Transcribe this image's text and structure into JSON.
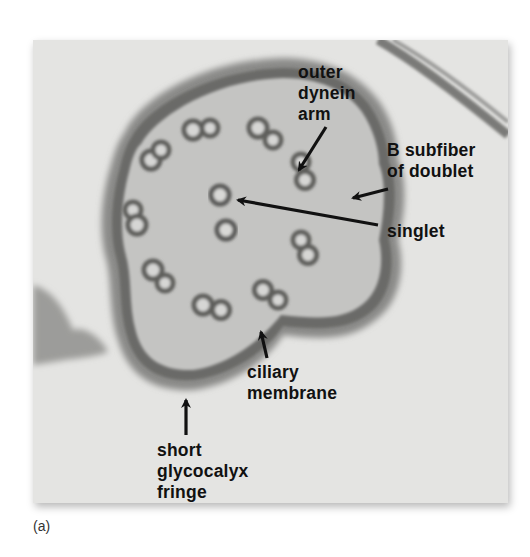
{
  "figure": {
    "panel_label": "(a)",
    "labels": [
      {
        "id": "outer-dynein-arm",
        "text": "outer\ndynein\narm"
      },
      {
        "id": "b-subfiber",
        "text": "B subfiber\nof doublet"
      },
      {
        "id": "singlet",
        "text": "singlet"
      },
      {
        "id": "ciliary-membrane",
        "text": "ciliary\nmembrane"
      },
      {
        "id": "glycocalyx",
        "text": "short\nglycocalyx\nfringe"
      }
    ],
    "colors": {
      "background": "#e6e6e4",
      "membrane": "#6e6e6c",
      "label_text": "#111111",
      "arrow": "#111111"
    }
  }
}
